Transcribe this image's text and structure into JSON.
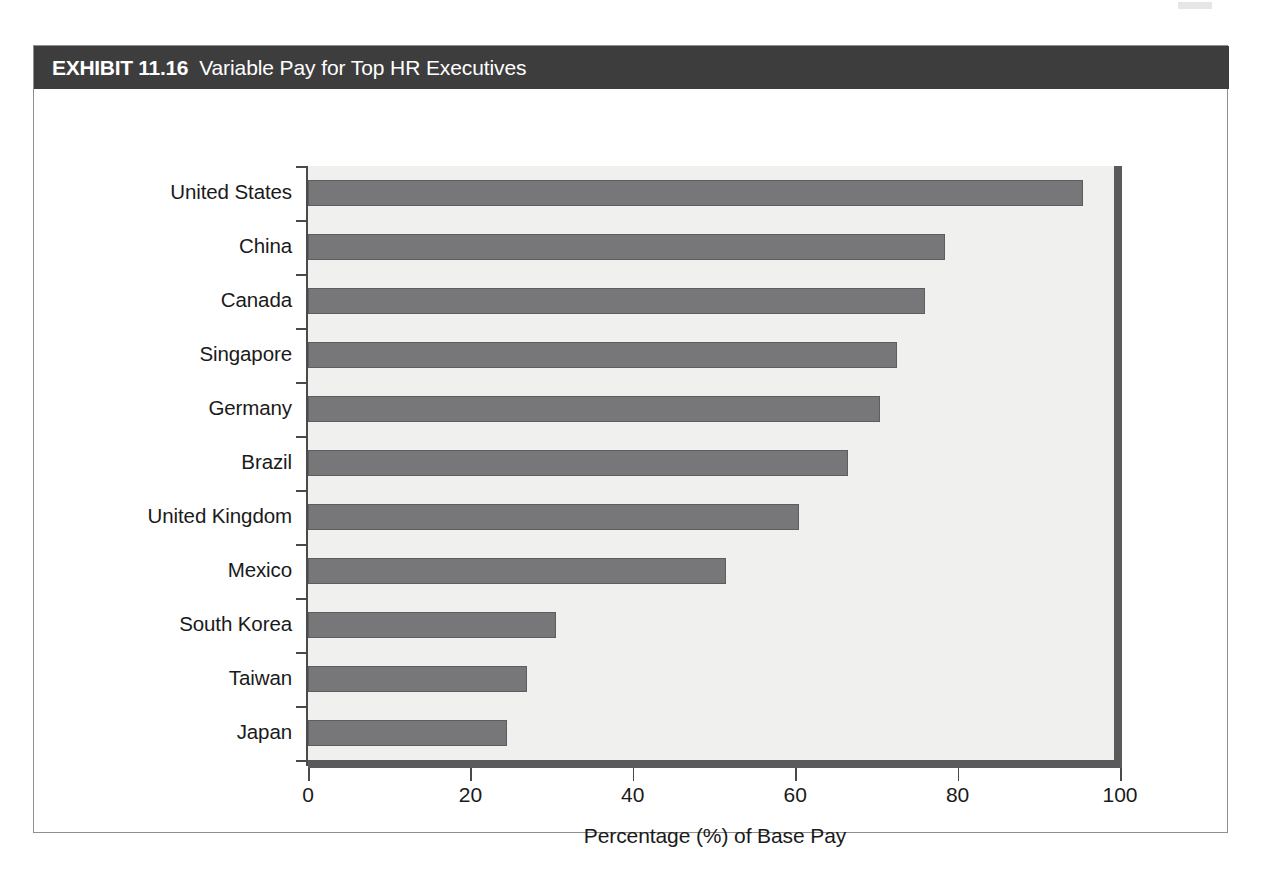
{
  "exhibit": {
    "number": "EXHIBIT 11.16",
    "caption": "Variable Pay for Top HR Executives"
  },
  "colors": {
    "banner_bg": "#3d3d3d",
    "bar_fill": "#77777a",
    "bar_stroke": "#5d5d60",
    "plot_bg": "#f0f0ee",
    "axis": "#4a4a4a",
    "shadow": "#5a5a5c",
    "frame_border": "#8f8f8f"
  },
  "chart_data": {
    "type": "bar",
    "orientation": "horizontal",
    "title": "Variable Pay for Top HR Executives",
    "xlabel": "Percentage (%) of Base Pay",
    "ylabel": "",
    "xlim": [
      0,
      100
    ],
    "xticks": [
      0,
      20,
      40,
      60,
      80,
      100
    ],
    "xtick_labels": [
      "0",
      "20",
      "40",
      "60",
      "80",
      "100"
    ],
    "grid": false,
    "legend": null,
    "categories": [
      "United States",
      "China",
      "Canada",
      "Singapore",
      "Germany",
      "Brazil",
      "United Kingdom",
      "Mexico",
      "South Korea",
      "Taiwan",
      "Japan"
    ],
    "values": [
      95.5,
      78.5,
      76,
      72.5,
      70.5,
      66.5,
      60.5,
      51.5,
      30.5,
      27,
      24.5
    ]
  }
}
